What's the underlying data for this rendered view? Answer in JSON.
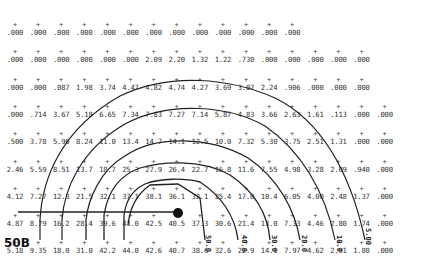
{
  "figure": {
    "label": "50B",
    "source_marker": {
      "x": 176,
      "y": 213
    },
    "contour_labels": [
      "50.0",
      "40.0",
      "30.0",
      "20.0",
      "10.0",
      "5.00"
    ]
  },
  "chart_data": {
    "type": "heatmap",
    "title": "50B",
    "columns": 13,
    "rows": [
      [
        ".000",
        ".000",
        ".000",
        ".000",
        ".000",
        ".000",
        ".000",
        ".000",
        ".000",
        ".000",
        ".000",
        ".000",
        ".000"
      ],
      [
        ".000",
        ".000",
        ".000",
        ".000",
        ".000",
        ".000",
        "2.09",
        "2.20",
        "1.32",
        "1.22",
        ".730",
        ".000",
        ".000",
        ".000",
        ".000",
        ".000"
      ],
      [
        ".000",
        ".000",
        ".087",
        "1.98",
        "3.74",
        "4.47",
        "4.82",
        "4.74",
        "4.27",
        "3.69",
        "3.07",
        "2.24",
        ".906",
        ".000",
        ".000",
        ".000"
      ],
      [
        ".000",
        ".714",
        "3.67",
        "5.18",
        "6.65",
        "7.34",
        "7.83",
        "7.27",
        "7.14",
        "5.87",
        "4.83",
        "3.66",
        "2.63",
        "1.61",
        ".113",
        ".000",
        ".000"
      ],
      [
        ".500",
        "3.78",
        "5.96",
        "8.24",
        "11.0",
        "13.4",
        "14.7",
        "14.1",
        "12.5",
        "10.0",
        "7.32",
        "5.30",
        "3.75",
        "2.51",
        "1.31",
        ".000",
        ".000"
      ],
      [
        "2.46",
        "5.59",
        "8.51",
        "13.7",
        "18.7",
        "25.3",
        "27.9",
        "26.4",
        "22.7",
        "16.8",
        "11.6",
        "7.55",
        "4.98",
        "3.28",
        "2.09",
        ".940",
        ".000"
      ],
      [
        "4.12",
        "7.27",
        "12.3",
        "21.5",
        "32.1",
        "37.1",
        "38.1",
        "36.1",
        "32.1",
        "25.4",
        "17.0",
        "10.4",
        "6.05",
        "4.00",
        "2.48",
        "1.37",
        ".000"
      ],
      [
        "4.87",
        "8.79",
        "16.2",
        "28.4",
        "39.6",
        "43.0",
        "42.5",
        "40.5",
        "37.3",
        "30.6",
        "21.4",
        "13.0",
        "7.33",
        "4.46",
        "2.80",
        "1.74",
        ".000"
      ],
      [
        "5.18",
        "9.35",
        "18.0",
        "31.0",
        "42.2",
        "44.0",
        "42.6",
        "40.7",
        "38.6",
        "32.6",
        "22.9",
        "14.1",
        "7.97",
        "4.62",
        "2.91",
        "1.80",
        ".000"
      ]
    ],
    "contour_levels": [
      5.0,
      10.0,
      20.0,
      30.0,
      40.0,
      50.0
    ],
    "grid": true,
    "legend": null
  }
}
